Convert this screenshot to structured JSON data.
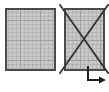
{
  "canvas": {
    "width": 109,
    "height": 92,
    "background_color": "#ffffff"
  },
  "palette": {
    "grid_fill": "#c8c8c8",
    "grid_line": "#b0b0b0",
    "grid_line_major": "#9a9a9a",
    "shape_border": "#4a4a4a",
    "cross_stroke": "#333333",
    "arrow_stroke": "#1e1e1e"
  },
  "shapes": [
    {
      "name": "grid-square-left",
      "label": "",
      "type": "grid-square",
      "x": 6,
      "y": 9,
      "width": 49,
      "height": 61,
      "cell_size": 4,
      "major_every": 5,
      "fill": "#c8c8c8",
      "border": "#4a4a4a",
      "border_width": 1.6,
      "crossed_out": false
    },
    {
      "name": "grid-square-right",
      "label": "",
      "type": "grid-square",
      "x": 65,
      "y": 9,
      "width": 39,
      "height": 61,
      "cell_size": 4,
      "major_every": 5,
      "fill": "#c8c8c8",
      "border": "#4a4a4a",
      "border_width": 1.6,
      "crossed_out": true
    }
  ],
  "cross_mark": {
    "name": "cross-out-mark",
    "target": "grid-square-right",
    "stroke": "#333333",
    "stroke_width": 1.8,
    "x1": 60,
    "y1": 5,
    "x2": 108,
    "y2": 73,
    "x3": 108,
    "y3": 5,
    "x4": 60,
    "y4": 73
  },
  "arrow": {
    "name": "elbow-arrow",
    "description": "down then right with arrowhead",
    "stroke": "#1e1e1e",
    "stroke_width": 2,
    "start_x": 88,
    "start_y": 66,
    "elbow_x": 88,
    "elbow_y": 80,
    "end_x": 99,
    "end_y": 80,
    "head_size": 5
  }
}
